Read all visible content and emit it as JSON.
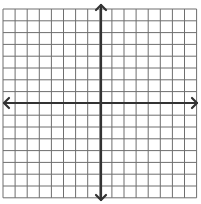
{
  "diagram": {
    "type": "coordinate-plane",
    "grid": {
      "columns": 16,
      "rows": 16,
      "x_start": 3,
      "y_start": 9,
      "cell_w": 12.1,
      "cell_h": 11.8,
      "line_color": "#6e6e6e",
      "line_width": 1
    },
    "axes": {
      "x_axis_y": 103,
      "y_axis_x": 101,
      "x_from": 4,
      "x_to": 197,
      "y_from": 5,
      "y_to": 200,
      "color": "#333333",
      "width": 2.2,
      "arrows": [
        "up",
        "down",
        "left",
        "right"
      ]
    },
    "background": "#ffffff"
  }
}
